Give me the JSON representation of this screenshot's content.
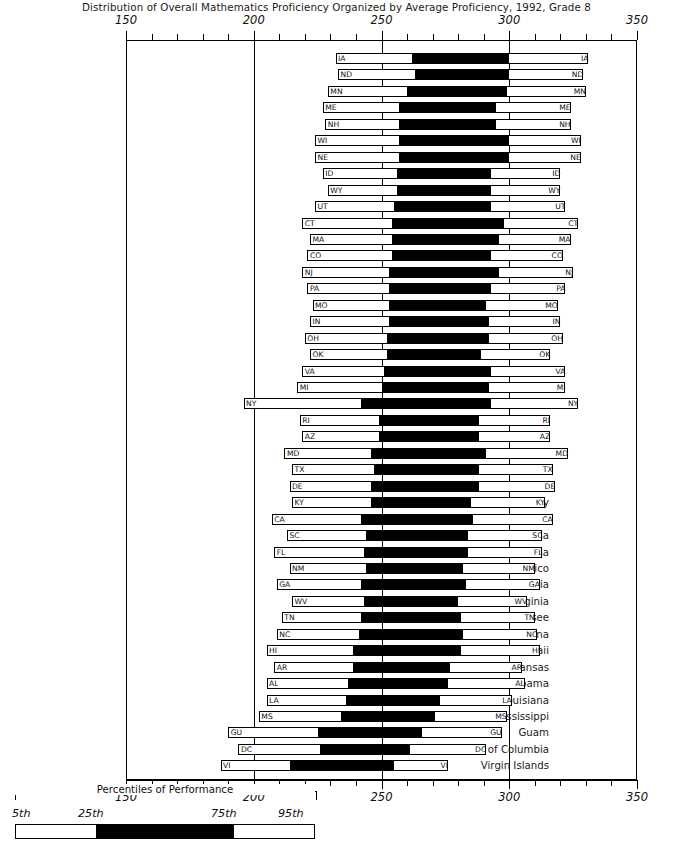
{
  "title": "Distribution of Overall Mathematics Proficiency Organized by Average Proficiency, 1992, Grade 8",
  "legend": {
    "caption": "Percentiles of Performance",
    "ticks": [
      "5th",
      "25th",
      "75th",
      "95th"
    ]
  },
  "chart_data": {
    "type": "bar",
    "subtype": "percentile-box-plot",
    "title": "Distribution of Overall Mathematics Proficiency Organized by Average Proficiency, 1992, Grade 8",
    "xlabel": "",
    "ylabel": "",
    "xlim": [
      150,
      350
    ],
    "xticks": [
      150,
      200,
      250,
      300,
      350
    ],
    "xtick_labels": [
      "150",
      "200",
      "250",
      "300",
      "350"
    ],
    "minor_tick_step": 10,
    "gridlines": [
      200,
      250,
      300
    ],
    "grid": true,
    "legend_position": "bottom-left",
    "percentiles": [
      "5th",
      "25th",
      "75th",
      "95th"
    ],
    "axis_top": true,
    "axis_bottom": true,
    "rows": [
      {
        "name": "Iowa",
        "code": "IA",
        "p5": 232,
        "p25": 262,
        "p75": 300,
        "p95": 331
      },
      {
        "name": "North Dakota",
        "code": "ND",
        "p5": 233,
        "p25": 263,
        "p75": 300,
        "p95": 329
      },
      {
        "name": "Minnesota",
        "code": "MN",
        "p5": 229,
        "p25": 260,
        "p75": 299,
        "p95": 330
      },
      {
        "name": "Maine",
        "code": "ME",
        "p5": 227,
        "p25": 257,
        "p75": 295,
        "p95": 324
      },
      {
        "name": "New Hampshire",
        "code": "NH",
        "p5": 228,
        "p25": 257,
        "p75": 295,
        "p95": 324
      },
      {
        "name": "Wisconsin",
        "code": "WI",
        "p5": 224,
        "p25": 257,
        "p75": 300,
        "p95": 328
      },
      {
        "name": "Nebraska",
        "code": "NE",
        "p5": 224,
        "p25": 257,
        "p75": 300,
        "p95": 328
      },
      {
        "name": "Idaho",
        "code": "ID",
        "p5": 227,
        "p25": 256,
        "p75": 293,
        "p95": 320
      },
      {
        "name": "Wyoming",
        "code": "WY",
        "p5": 229,
        "p25": 256,
        "p75": 293,
        "p95": 320
      },
      {
        "name": "Utah",
        "code": "UT",
        "p5": 224,
        "p25": 255,
        "p75": 293,
        "p95": 322
      },
      {
        "name": "Connecticut",
        "code": "CT",
        "p5": 219,
        "p25": 254,
        "p75": 298,
        "p95": 327
      },
      {
        "name": "Massachusetts",
        "code": "MA",
        "p5": 222,
        "p25": 254,
        "p75": 296,
        "p95": 324
      },
      {
        "name": "Colorado",
        "code": "CO",
        "p5": 221,
        "p25": 254,
        "p75": 293,
        "p95": 321
      },
      {
        "name": "New Jersey",
        "code": "NJ",
        "p5": 219,
        "p25": 253,
        "p75": 296,
        "p95": 325
      },
      {
        "name": "Pennsylvania",
        "code": "PA",
        "p5": 221,
        "p25": 253,
        "p75": 293,
        "p95": 322
      },
      {
        "name": "Missouri",
        "code": "MO",
        "p5": 223,
        "p25": 253,
        "p75": 291,
        "p95": 319
      },
      {
        "name": "Indiana",
        "code": "IN",
        "p5": 222,
        "p25": 253,
        "p75": 292,
        "p95": 320
      },
      {
        "name": "Ohio",
        "code": "OH",
        "p5": 220,
        "p25": 252,
        "p75": 292,
        "p95": 321
      },
      {
        "name": "Oklahoma",
        "code": "OK",
        "p5": 222,
        "p25": 252,
        "p75": 289,
        "p95": 316
      },
      {
        "name": "Virginia",
        "code": "VA",
        "p5": 219,
        "p25": 251,
        "p75": 293,
        "p95": 322
      },
      {
        "name": "Michigan",
        "code": "MI",
        "p5": 217,
        "p25": 250,
        "p75": 292,
        "p95": 322
      },
      {
        "name": "New York",
        "code": "NY",
        "p5": 196,
        "p25": 242,
        "p75": 293,
        "p95": 327
      },
      {
        "name": "Rhode Island",
        "code": "RI",
        "p5": 218,
        "p25": 249,
        "p75": 288,
        "p95": 316
      },
      {
        "name": "Arizona",
        "code": "AZ",
        "p5": 219,
        "p25": 249,
        "p75": 288,
        "p95": 316
      },
      {
        "name": "Maryland",
        "code": "MD",
        "p5": 212,
        "p25": 246,
        "p75": 291,
        "p95": 323
      },
      {
        "name": "Texas",
        "code": "TX",
        "p5": 215,
        "p25": 247,
        "p75": 288,
        "p95": 317
      },
      {
        "name": "Delaware",
        "code": "DE",
        "p5": 214,
        "p25": 246,
        "p75": 288,
        "p95": 318
      },
      {
        "name": "Kentucky",
        "code": "KY",
        "p5": 215,
        "p25": 246,
        "p75": 285,
        "p95": 314
      },
      {
        "name": "California",
        "code": "CA",
        "p5": 207,
        "p25": 242,
        "p75": 286,
        "p95": 317
      },
      {
        "name": "South Carolina",
        "code": "SC",
        "p5": 213,
        "p25": 244,
        "p75": 284,
        "p95": 313
      },
      {
        "name": "Florida",
        "code": "FL",
        "p5": 208,
        "p25": 243,
        "p75": 284,
        "p95": 313
      },
      {
        "name": "New Mexico",
        "code": "NM",
        "p5": 214,
        "p25": 244,
        "p75": 282,
        "p95": 310
      },
      {
        "name": "Georgia",
        "code": "GA",
        "p5": 209,
        "p25": 242,
        "p75": 283,
        "p95": 312
      },
      {
        "name": "West Virginia",
        "code": "WV",
        "p5": 215,
        "p25": 243,
        "p75": 280,
        "p95": 307
      },
      {
        "name": "Tennessee",
        "code": "TN",
        "p5": 211,
        "p25": 242,
        "p75": 281,
        "p95": 310
      },
      {
        "name": "North Carolina",
        "code": "NC",
        "p5": 209,
        "p25": 241,
        "p75": 282,
        "p95": 311
      },
      {
        "name": "Hawaii",
        "code": "HI",
        "p5": 205,
        "p25": 239,
        "p75": 281,
        "p95": 312
      },
      {
        "name": "Arkansas",
        "code": "AR",
        "p5": 208,
        "p25": 239,
        "p75": 277,
        "p95": 305
      },
      {
        "name": "Alabama",
        "code": "AL",
        "p5": 205,
        "p25": 237,
        "p75": 276,
        "p95": 306
      },
      {
        "name": "Louisiana",
        "code": "LA",
        "p5": 205,
        "p25": 236,
        "p75": 273,
        "p95": 301
      },
      {
        "name": "Mississippi",
        "code": "MS",
        "p5": 202,
        "p25": 234,
        "p75": 271,
        "p95": 299
      },
      {
        "name": "Guam",
        "code": "GU",
        "p5": 190,
        "p25": 225,
        "p75": 266,
        "p95": 297
      },
      {
        "name": "District of Columbia",
        "code": "DC",
        "p5": 194,
        "p25": 226,
        "p75": 261,
        "p95": 291
      },
      {
        "name": "Virgin Islands",
        "code": "VI",
        "p5": 187,
        "p25": 214,
        "p75": 255,
        "p95": 276
      }
    ]
  }
}
